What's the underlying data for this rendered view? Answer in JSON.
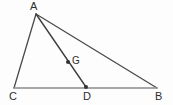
{
  "figure": {
    "type": "geometry-diagram",
    "width": 173,
    "height": 105,
    "background_color": "#fdfdfd",
    "points": {
      "A": {
        "label": "A",
        "x": 36,
        "y": 14,
        "label_x": 30,
        "label_y": 1,
        "marker": false
      },
      "B": {
        "label": "B",
        "x": 157,
        "y": 88,
        "label_x": 155,
        "label_y": 91,
        "marker": false
      },
      "C": {
        "label": "C",
        "x": 14,
        "y": 88,
        "label_x": 9,
        "label_y": 91,
        "marker": false
      },
      "D": {
        "label": "D",
        "x": 86,
        "y": 87,
        "label_x": 83,
        "label_y": 91,
        "marker": true
      },
      "G": {
        "label": "G",
        "x": 68,
        "y": 62,
        "label_x": 72,
        "label_y": 56,
        "marker": true
      }
    },
    "segments": [
      {
        "name": "AC",
        "from": "A",
        "to": "C",
        "color": "#4a4a4a",
        "width": 1.3
      },
      {
        "name": "AB",
        "from": "A",
        "to": "B",
        "color": "#4a4a4a",
        "width": 1.3
      },
      {
        "name": "AD",
        "from": "A",
        "to": "D",
        "color": "#3f3f3f",
        "width": 1.4
      },
      {
        "name": "CB",
        "from": "C",
        "to": "B",
        "color": "#8a8a8a",
        "width": 1.6
      }
    ],
    "marker_color": "#333333",
    "marker_size": 2.0,
    "line_color": "#4a4a4a",
    "base_line_color": "#8a8a8a",
    "label_color": "#2e2e2e"
  }
}
